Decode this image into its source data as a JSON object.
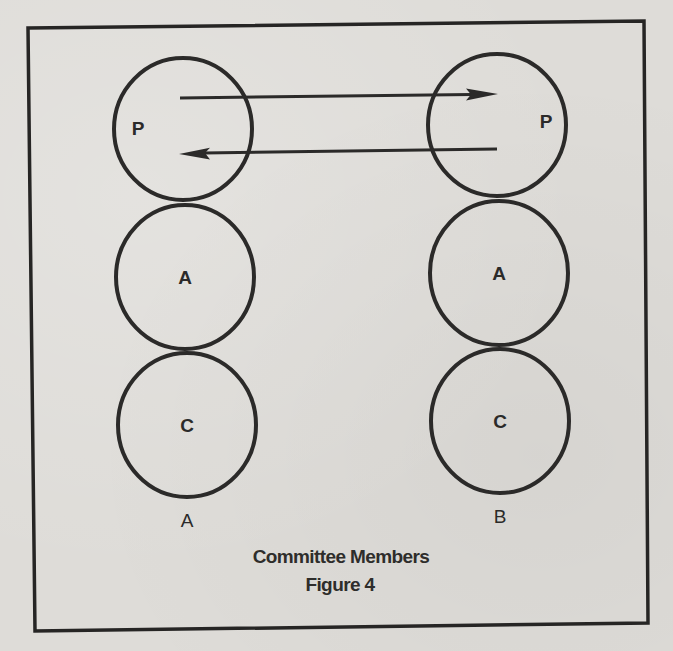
{
  "figure": {
    "caption_title": "Committee Members",
    "caption_number": "Figure 4"
  },
  "colors": {
    "background": "#dedcd8",
    "ink": "#2b2a29"
  },
  "columns": [
    {
      "label": "A",
      "nodes": [
        {
          "letter": "P",
          "role": "top"
        },
        {
          "letter": "A",
          "role": "middle"
        },
        {
          "letter": "C",
          "role": "bottom"
        }
      ]
    },
    {
      "label": "B",
      "nodes": [
        {
          "letter": "P",
          "role": "top"
        },
        {
          "letter": "A",
          "role": "middle"
        },
        {
          "letter": "C",
          "role": "bottom"
        }
      ]
    }
  ],
  "connections": [
    {
      "from": "A.P",
      "to": "B.P",
      "direction": "right"
    },
    {
      "from": "B.P",
      "to": "A.P",
      "direction": "left"
    }
  ]
}
